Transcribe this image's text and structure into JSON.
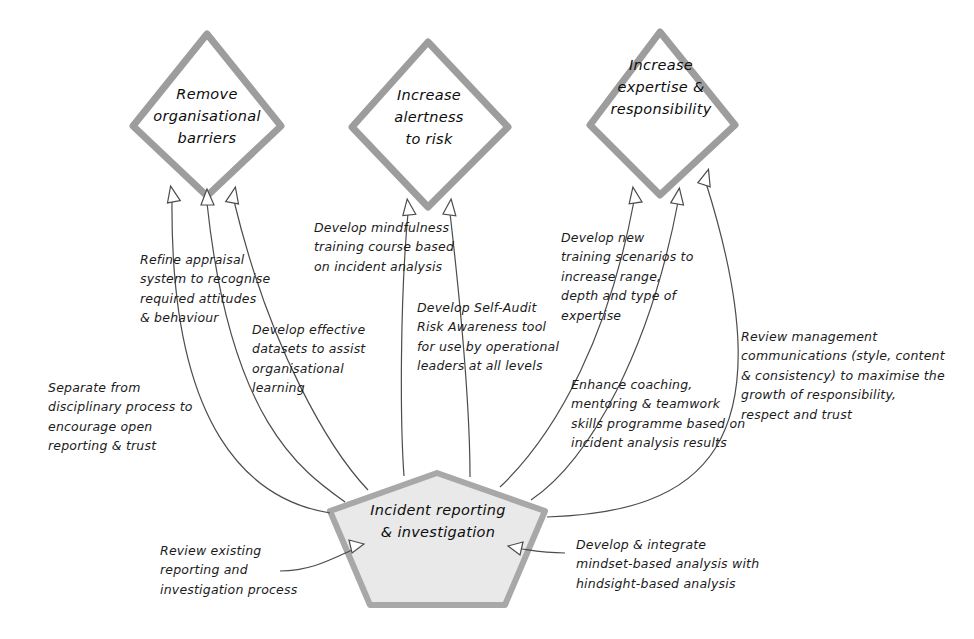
{
  "diagram": {
    "colors": {
      "shape_stroke": "#9d9d9d",
      "pentagon_fill": "#e9e9e9",
      "pentagon_stroke": "#a8a8a8",
      "connector": "#4c4c4c",
      "text": "#1b1b1b",
      "background": "#ffffff"
    },
    "center_node": {
      "shape": "pentagon",
      "label": "Incident reporting\n& investigation"
    },
    "goal_nodes": [
      {
        "shape": "diamond",
        "label": "Remove\norganisational\nbarriers"
      },
      {
        "shape": "diamond",
        "label": "Increase\nalertness\nto risk"
      },
      {
        "shape": "diamond",
        "label": "Increase\nexpertise &\nresponsibility"
      }
    ],
    "action_labels": [
      {
        "id": "refine-appraisal",
        "text": "Refine appraisal\nsystem to recognise\nrequired attitudes\n& behaviour"
      },
      {
        "id": "separate-disciplinary",
        "text": "Separate from\ndisciplinary process to\nencourage open\nreporting & trust"
      },
      {
        "id": "develop-datasets",
        "text": "Develop effective\ndatasets to assist\norganisational\nlearning"
      },
      {
        "id": "develop-mindfulness",
        "text": "Develop mindfulness\ntraining course based\non incident analysis"
      },
      {
        "id": "develop-self-audit",
        "text": "Develop Self-Audit\nRisk Awareness tool\nfor use by operational\nleaders at all levels"
      },
      {
        "id": "develop-training-scenarios",
        "text": "Develop new\ntraining scenarios to\nincrease range,\ndepth and type of\nexpertise"
      },
      {
        "id": "enhance-coaching",
        "text": "Enhance coaching,\nmentoring & teamwork\nskills programme based on\nincident analysis results"
      },
      {
        "id": "review-management-comms",
        "text": "Review management\ncommunications (style, content\n& consistency) to maximise the\ngrowth of responsibility,\nrespect and trust"
      },
      {
        "id": "review-existing-process",
        "text": "Review existing\nreporting and\ninvestigation process"
      },
      {
        "id": "develop-integrate-mindset",
        "text": "Develop & integrate\nmindset-based analysis with\nhindsight-based analysis"
      }
    ]
  }
}
